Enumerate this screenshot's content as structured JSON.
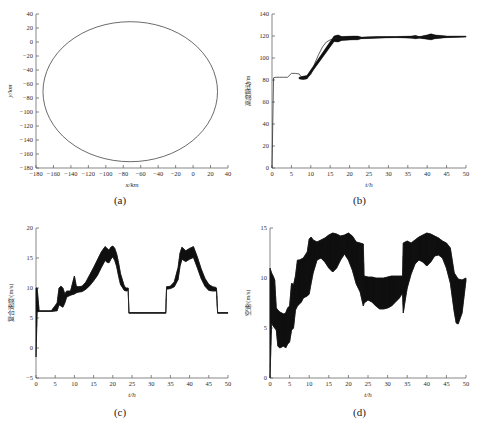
{
  "figure": {
    "panels": [
      {
        "caption": "(a)",
        "xlabel": "x/km",
        "ylabel": "y/km",
        "xticks": [
          -180,
          -160,
          -140,
          -120,
          -100,
          -80,
          -60,
          -40,
          -20,
          0,
          20,
          40
        ],
        "yticks": [
          40,
          20,
          0,
          -20,
          -40,
          -60,
          -80,
          -100,
          -120,
          -140,
          -160,
          -180
        ],
        "xlim": [
          -180,
          40
        ],
        "ylim": [
          -180,
          40
        ]
      },
      {
        "caption": "(b)",
        "xlabel": "t/h",
        "ylabel": "高度脉动/m",
        "xticks": [
          0,
          5,
          10,
          15,
          20,
          25,
          30,
          35,
          40,
          45,
          50
        ],
        "yticks": [
          0,
          20,
          40,
          60,
          80,
          100,
          120,
          140
        ],
        "xlim": [
          0,
          50
        ],
        "ylim": [
          0,
          140
        ]
      },
      {
        "caption": "(c)",
        "xlabel": "t/h",
        "ylabel": "复合速度/(m/s)",
        "xticks": [
          0,
          5,
          10,
          15,
          20,
          25,
          30,
          35,
          40,
          45,
          50
        ],
        "yticks": [
          -5,
          0,
          5,
          10,
          15,
          20
        ],
        "xlim": [
          0,
          50
        ],
        "ylim": [
          -5,
          20
        ]
      },
      {
        "caption": "(d)",
        "xlabel": "t/h",
        "ylabel": "空速/(m/s)",
        "xticks": [
          0,
          5,
          10,
          15,
          20,
          25,
          30,
          35,
          40,
          45,
          50
        ],
        "yticks": [
          0,
          5,
          10,
          15
        ],
        "xlim": [
          0,
          50
        ],
        "ylim": [
          0,
          15
        ]
      }
    ]
  },
  "chart_data": [
    {
      "type": "line",
      "title": "",
      "panel": "(a)",
      "xlabel": "x/km",
      "ylabel": "y/km",
      "xlim": [
        -180,
        40
      ],
      "ylim": [
        -180,
        40
      ],
      "grid": false,
      "legend": null,
      "description": "Closed elliptical flight trajectory, centre near (-72,-71), semi-axis x about 100 km, semi-axis y about 100 km",
      "ellipse": {
        "cx": -72,
        "cy": -71,
        "rx": 100,
        "ry": 100
      },
      "series": [
        {
          "name": "trajectory",
          "x": [
            27,
            24,
            15,
            2,
            -14,
            -32,
            -52,
            -72,
            -92,
            -112,
            -130,
            -146,
            -158,
            -168,
            -172,
            -170,
            -163,
            -152,
            -137,
            -119,
            -99,
            -79,
            -58,
            -38,
            -20,
            -4,
            9,
            19,
            25,
            27
          ],
          "y": [
            -71,
            -46,
            -23,
            -5,
            8,
            20,
            27,
            29,
            27,
            21,
            12,
            0,
            -16,
            -38,
            -62,
            -86,
            -108,
            -128,
            -145,
            -159,
            -168,
            -171,
            -169,
            -163,
            -153,
            -140,
            -122,
            -102,
            -86,
            -71
          ]
        }
      ]
    },
    {
      "type": "line",
      "title": "",
      "panel": "(b)",
      "xlabel": "t/h",
      "ylabel": "高度脉动/m",
      "xlim": [
        0,
        50
      ],
      "ylim": [
        0,
        140
      ],
      "grid": false,
      "legend": null,
      "description": "Altitude fluctuation rises from about 82 m, steps to 86 m, dips near t=8 h, climbs steeply between t=10 and t=15 h to roughly 118 m, then holds near 119-120 m with intermittent oscillation bursts",
      "series": [
        {
          "name": "altitude-mean",
          "x": [
            0,
            0.4,
            1,
            2,
            3,
            4,
            5,
            6,
            7,
            7.5,
            8,
            8.5,
            9,
            9.5,
            10,
            10.5,
            11,
            12,
            13,
            14,
            15,
            16,
            17,
            18,
            19,
            20,
            21,
            22,
            24,
            26,
            28,
            30,
            32,
            34,
            36,
            38,
            40,
            42,
            44,
            46,
            48,
            50
          ],
          "y": [
            0,
            82,
            82.5,
            82.5,
            82.5,
            82.5,
            86,
            86,
            85.5,
            83,
            81.5,
            81.5,
            82.5,
            83.5,
            85,
            89,
            95,
            103,
            110,
            114.5,
            116.5,
            117.5,
            118,
            117.5,
            117.8,
            118,
            118.2,
            118,
            118.3,
            118.5,
            118.7,
            119,
            119,
            119.2,
            119,
            119.2,
            119.3,
            119.2,
            119.3,
            119.4,
            119.4,
            119.5
          ]
        },
        {
          "name": "altitude-envelope-upper",
          "x": [
            7,
            8,
            9,
            16,
            17,
            18,
            21,
            22,
            23,
            27,
            32,
            36,
            37,
            38,
            40,
            41,
            42,
            45,
            50
          ],
          "y": [
            82.5,
            83.5,
            84,
            120,
            121,
            119.5,
            120,
            120,
            119,
            119.5,
            119.5,
            120,
            120.5,
            119.5,
            121,
            122,
            121,
            120,
            120
          ]
        },
        {
          "name": "altitude-envelope-lower",
          "x": [
            7,
            8,
            9,
            16,
            17,
            18,
            21,
            22,
            23,
            27,
            32,
            36,
            37,
            38,
            40,
            41,
            42,
            45,
            50
          ],
          "y": [
            81,
            80.5,
            81,
            115,
            114.5,
            116,
            116.5,
            116.5,
            117.5,
            118,
            118.5,
            118,
            117.5,
            118,
            117,
            116.5,
            117.5,
            118.5,
            119
          ]
        }
      ]
    },
    {
      "type": "line",
      "title": "",
      "panel": "(c)",
      "xlabel": "t/h",
      "ylabel": "复合速度/(m/s)",
      "xlim": [
        0,
        50
      ],
      "ylim": [
        -5,
        20
      ],
      "grid": false,
      "legend": null,
      "description": "Composite speed starts with a spike to about 10 m/s, settles at a 6 m/s baseline, oscillates to 10 m/s around t=6-11 h, rises to a noisy twin peak near 17 m/s between t=18 and t=21 h, drops back to a flat 6 m/s plateau from t=24 to t=34 h, then repeats a second twin peak near 17 m/s at t=37-40 h before returning to 6 m/s after t=47 h",
      "series": [
        {
          "name": "composite-speed-upper",
          "x": [
            0,
            0.3,
            0.8,
            1,
            2,
            4,
            5.5,
            6,
            6.5,
            7,
            7.5,
            8,
            9,
            10,
            10.5,
            11,
            12,
            13,
            14,
            15,
            16,
            17,
            18,
            18.5,
            19,
            19.5,
            20,
            20.5,
            21,
            21.5,
            22,
            23,
            23.5,
            24,
            24.2,
            26,
            30,
            33.8,
            34,
            35,
            36,
            37,
            37.5,
            38,
            39,
            40,
            41,
            42,
            43,
            44,
            45,
            46,
            46.8,
            47,
            47.3,
            50
          ],
          "y": [
            10,
            10,
            6.3,
            6.2,
            6.2,
            6.2,
            7.5,
            10,
            10.3,
            10,
            9,
            9.5,
            9.5,
            12,
            10.3,
            10.2,
            10.3,
            11,
            12.2,
            13.4,
            14.7,
            16,
            16.9,
            16.6,
            16.3,
            16.8,
            17,
            16.6,
            15.7,
            14.2,
            12.4,
            10.3,
            10,
            10,
            5.9,
            5.9,
            5.9,
            5.9,
            10.2,
            10.3,
            11,
            13.4,
            15.8,
            16.8,
            16.2,
            16.6,
            16.9,
            15.2,
            13.2,
            11.6,
            10.6,
            10.2,
            10.1,
            10,
            5.9,
            5.9
          ]
        },
        {
          "name": "composite-speed-lower",
          "x": [
            0,
            0.3,
            0.8,
            1,
            2,
            4,
            5.5,
            6,
            6.5,
            7,
            7.5,
            8,
            9,
            10,
            10.5,
            11,
            12,
            13,
            14,
            15,
            16,
            17,
            18,
            18.5,
            19,
            19.5,
            20,
            20.5,
            21,
            21.5,
            22,
            23,
            23.5,
            24,
            24.2,
            26,
            30,
            33.8,
            34,
            35,
            36,
            37,
            37.5,
            38,
            39,
            40,
            41,
            42,
            43,
            44,
            45,
            46,
            46.8,
            47,
            47.3,
            50
          ],
          "y": [
            -1.5,
            6,
            6.1,
            6.1,
            6.1,
            6.1,
            6.2,
            7.2,
            7,
            6.8,
            7.5,
            8.5,
            8.8,
            9,
            9.2,
            9.3,
            9.4,
            9.8,
            10.4,
            11.2,
            12.1,
            13.4,
            14.6,
            14.3,
            14.2,
            14.8,
            15.2,
            14.6,
            13.6,
            12,
            10.6,
            9.6,
            9.5,
            9.6,
            5.8,
            5.8,
            5.8,
            5.8,
            9.8,
            9.9,
            10.2,
            11.4,
            13.6,
            14.8,
            14.4,
            14.8,
            15.1,
            13.4,
            11.6,
            10.3,
            9.6,
            9.5,
            9.5,
            9.5,
            5.8,
            5.8
          ]
        }
      ]
    },
    {
      "type": "line",
      "title": "",
      "panel": "(d)",
      "xlabel": "t/h",
      "ylabel": "空速/(m/s)",
      "xlim": [
        0,
        50
      ],
      "ylim": [
        0,
        15
      ],
      "grid": false,
      "legend": null,
      "description": "Airspeed band oscillates widely: initial spike to about 11 m/s, a low band near 3-7 m/s between t=2 and t=7 h, rising to a broad band oscillating between about 8 and 14.5 m/s from t=10 to t=24 h, a narrower band around 7-10 m/s from t=25 to t=33 h, then a second wide band 8-14.5 m/s from t=34 to t=47 h, ending near 10 m/s",
      "series": [
        {
          "name": "airspeed-upper",
          "x": [
            0,
            0.4,
            0.8,
            1.2,
            1.6,
            2,
            2.5,
            3,
            3.5,
            4,
            4.5,
            5,
            5.5,
            6,
            6.5,
            7,
            7.5,
            8,
            8.5,
            9,
            9.5,
            10,
            10.5,
            11,
            12,
            13,
            14,
            15,
            16,
            17,
            18,
            19,
            20,
            21,
            22,
            23,
            23.8,
            24,
            25,
            26,
            27,
            28,
            29,
            30,
            31,
            32,
            33,
            33.8,
            34,
            34.5,
            35,
            36,
            37,
            38,
            39,
            40,
            41,
            42,
            43,
            44,
            45,
            46,
            47,
            47.5,
            48,
            49,
            50
          ],
          "y": [
            11,
            10.5,
            10.2,
            9.8,
            7,
            6.8,
            6.6,
            6.5,
            6.4,
            6.5,
            7,
            7.2,
            9.5,
            9.3,
            10.2,
            11.8,
            11.8,
            11.9,
            12,
            12.3,
            12.6,
            13.9,
            14.1,
            13.8,
            13.6,
            13.8,
            14,
            14.3,
            14.5,
            14.4,
            14.2,
            14.3,
            14.5,
            14.2,
            13.6,
            13.5,
            13.4,
            10.2,
            10.1,
            10.1,
            10,
            10,
            10,
            10.1,
            10.2,
            10.2,
            10.2,
            10.2,
            13.5,
            13.6,
            13.7,
            13.5,
            13.8,
            14.1,
            14.3,
            14.5,
            14.4,
            14.2,
            14,
            13.7,
            13.5,
            13,
            10.5,
            10.2,
            9.9,
            9.8,
            10
          ]
        },
        {
          "name": "airspeed-lower",
          "x": [
            0,
            0.4,
            0.8,
            1.2,
            1.6,
            2,
            2.5,
            3,
            3.5,
            4,
            4.5,
            5,
            5.5,
            6,
            6.5,
            7,
            7.5,
            8,
            8.5,
            9,
            9.5,
            10,
            10.5,
            11,
            12,
            13,
            14,
            15,
            16,
            17,
            18,
            19,
            20,
            21,
            22,
            23,
            23.8,
            24,
            25,
            26,
            27,
            28,
            29,
            30,
            31,
            32,
            33,
            33.8,
            34,
            34.5,
            35,
            36,
            37,
            38,
            39,
            40,
            41,
            42,
            43,
            44,
            45,
            46,
            47,
            47.5,
            48,
            49,
            50
          ],
          "y": [
            0,
            5.5,
            5.2,
            5,
            4.8,
            3.2,
            3,
            3.1,
            3.2,
            3,
            3.4,
            3.6,
            4.8,
            5,
            6.8,
            7.2,
            7.4,
            7.6,
            8,
            8.1,
            8.2,
            8.4,
            9.5,
            10.5,
            11.8,
            12,
            11.6,
            11,
            10.6,
            11,
            11.8,
            12.4,
            11.8,
            10.8,
            9.4,
            8.6,
            7.2,
            7.5,
            7.8,
            7.6,
            7.2,
            6.9,
            6.9,
            7,
            7.2,
            7.6,
            8,
            8.5,
            6.5,
            7.8,
            9,
            10.4,
            11.4,
            11.8,
            11.6,
            11.2,
            11.6,
            12.2,
            12.3,
            12,
            11,
            9.5,
            6.6,
            5.5,
            5.4,
            6.5,
            9.8
          ]
        }
      ]
    }
  ]
}
